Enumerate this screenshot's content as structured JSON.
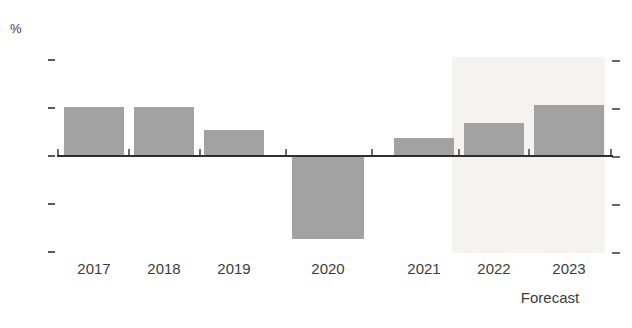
{
  "chart_data": {
    "type": "bar",
    "title": "",
    "subtitle": "",
    "xlabel": "",
    "ylabel": "%",
    "categories": [
      "2017",
      "2018",
      "2019",
      "2020",
      "2021",
      "2022",
      "2023"
    ],
    "values": [
      4.0,
      4.0,
      2.1,
      -6.8,
      1.4,
      2.7,
      4.2
    ],
    "series": [
      {
        "name": "GDP growth",
        "values": [
          4.0,
          4.0,
          2.1,
          -6.8,
          1.4,
          2.7,
          4.2
        ]
      }
    ],
    "ylim": [
      -8,
      8
    ],
    "yticks": [
      8,
      4,
      0,
      -4,
      -8
    ],
    "ytick_labels": [
      "8",
      "4",
      "0",
      "-4",
      "-8"
    ],
    "grid": false,
    "legend": false,
    "legend_position": "none",
    "bar_color": "#a2a2a2",
    "baseline_color": "#2e2e2e",
    "forecast_band_color": "#f4f3f1",
    "annotations": [
      {
        "text": "Forecast",
        "applies_to": [
          "2022",
          "2023"
        ]
      }
    ]
  },
  "axes": {
    "y_unit": "%",
    "y_ticks": [
      {
        "label": "8",
        "value": 8
      },
      {
        "label": "4",
        "value": 4
      },
      {
        "label": "0",
        "value": 0
      },
      {
        "label": "-4",
        "value": -4
      },
      {
        "label": "-8",
        "value": -8
      }
    ],
    "x_categories": [
      {
        "label": "2017"
      },
      {
        "label": "2018"
      },
      {
        "label": "2019"
      },
      {
        "label": "2020"
      },
      {
        "label": "2021"
      },
      {
        "label": "2022"
      },
      {
        "label": "2023"
      }
    ]
  },
  "forecast": {
    "label": "Forecast"
  }
}
